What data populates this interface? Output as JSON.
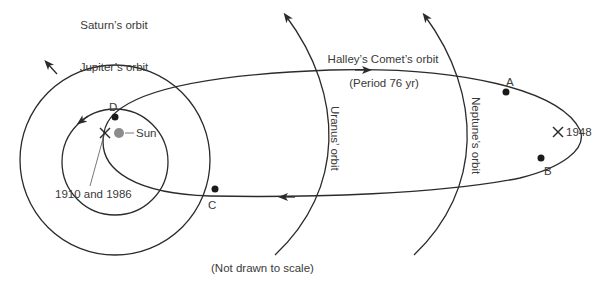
{
  "diagram": {
    "labels": {
      "saturn": "Saturn’s orbit",
      "jupiter": "Jupiter’s orbit",
      "uranus": "Uranus’ orbit",
      "neptune": "Neptune’s orbit",
      "halley": "Halley’s Comet’s orbit",
      "period": "(Period 76 yr)",
      "sun": "Sun",
      "perihelion": "1910 and 1986",
      "aphelion": "1948",
      "note": "(Not drawn to scale)"
    },
    "points": {
      "A": "A",
      "B": "B",
      "C": "C",
      "D": "D"
    },
    "colors": {
      "line": "#2b2b2b",
      "sun": "#8c8c8c",
      "text": "#3a3a3a",
      "background": "#ffffff"
    }
  }
}
